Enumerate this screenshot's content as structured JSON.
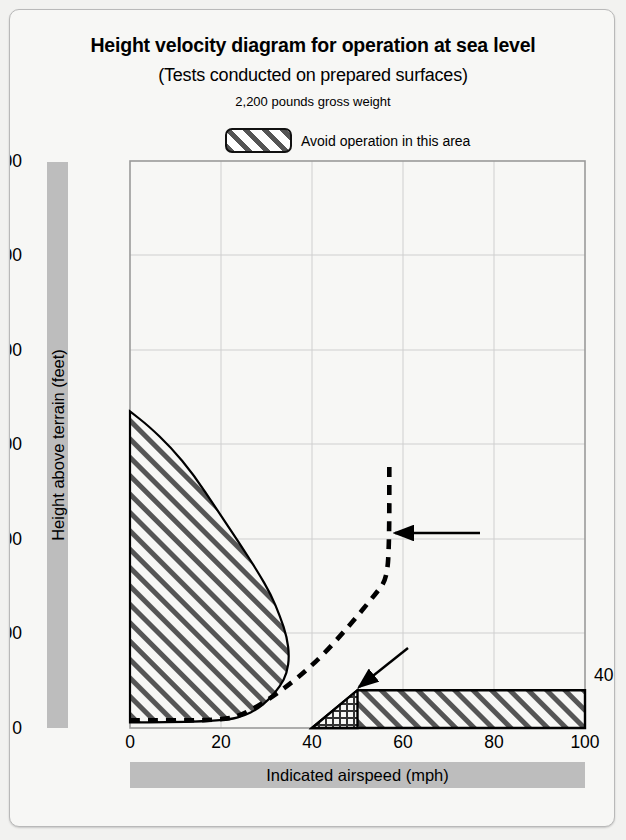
{
  "title": "Height velocity diagram for operation at sea level",
  "subtitle": "(Tests conducted on prepared surfaces)",
  "subtitle2": "2,200 pounds gross weight",
  "legend": {
    "label": "Avoid operation in this area",
    "swatch_icon": "hatched-swatch-icon"
  },
  "annotations": {
    "safe_area": "Safe operating area",
    "takeoff_profile": "Recommended takeoff\nprofile",
    "best_rate_of_climb": "Best rate of climb speed\nat sea level",
    "caution": "Use caution in this area to\navoid contact of tail rotor\nguard with ground",
    "height_label_40": "40"
  },
  "colors": {
    "hatch": "#555555",
    "gridline": "#cfcfcf",
    "axis": "#9a9a9a",
    "bar_gray": "#bdbdbd",
    "background": "#f7f7f5",
    "outline": "#111111"
  },
  "chart_data": {
    "type": "line",
    "title": "Height velocity diagram for operation at sea level",
    "subtitle": "(Tests conducted on prepared surfaces) 2,200 pounds gross weight",
    "xlabel": "Indicated airspeed (mph)",
    "ylabel": "Height above terrain (feet)",
    "xlim": [
      0,
      100
    ],
    "ylim": [
      0,
      600
    ],
    "xticks": [
      0,
      20,
      40,
      60,
      80,
      100
    ],
    "yticks": [
      0,
      100,
      200,
      300,
      400,
      500,
      600
    ],
    "grid": true,
    "legend_position": "above-plot",
    "series": [
      {
        "name": "Avoid operation region (low-speed/high-hover)",
        "type": "filled-region",
        "fill": "diagonal-hatch",
        "points": [
          [
            0,
            335
          ],
          [
            4,
            320
          ],
          [
            9,
            297
          ],
          [
            14,
            268
          ],
          [
            19,
            232
          ],
          [
            24,
            196
          ],
          [
            28,
            166
          ],
          [
            31,
            141
          ],
          [
            33,
            118
          ],
          [
            34.5,
            96
          ],
          [
            35,
            76
          ],
          [
            34.5,
            58
          ],
          [
            33,
            44
          ],
          [
            30.5,
            30
          ],
          [
            28,
            20
          ],
          [
            25,
            13
          ],
          [
            22,
            9
          ],
          [
            16,
            7
          ],
          [
            8,
            6
          ],
          [
            0,
            6
          ]
        ]
      },
      {
        "name": "Avoid operation region (low-altitude tail rotor guard)",
        "type": "filled-region",
        "fill": "diagonal-hatch",
        "points": [
          [
            40,
            0
          ],
          [
            50,
            40
          ],
          [
            100,
            40
          ],
          [
            100,
            0
          ]
        ]
      },
      {
        "name": "Caution sub-area (tail rotor guard contact)",
        "type": "filled-region",
        "fill": "cross-hatch",
        "points": [
          [
            40,
            0
          ],
          [
            50,
            40
          ],
          [
            50,
            0
          ]
        ]
      },
      {
        "name": "Recommended takeoff profile",
        "type": "dashed-line",
        "points": [
          [
            0,
            8
          ],
          [
            20,
            8
          ],
          [
            25,
            14
          ],
          [
            33,
            38
          ],
          [
            41,
            70
          ],
          [
            48,
            107
          ],
          [
            54,
            142
          ],
          [
            56.5,
            158
          ],
          [
            57,
            200
          ],
          [
            57,
            277
          ]
        ]
      }
    ],
    "markers": [
      {
        "name": "Best rate of climb speed at sea level",
        "type": "arrow-annotation",
        "point": [
          57,
          213
        ],
        "label": "Best rate of climb speed at sea level"
      },
      {
        "name": "Tail rotor guard caution",
        "type": "arrow-annotation",
        "point": [
          50,
          42
        ],
        "label": "Use caution in this area to avoid contact of tail rotor guard with ground"
      }
    ]
  }
}
